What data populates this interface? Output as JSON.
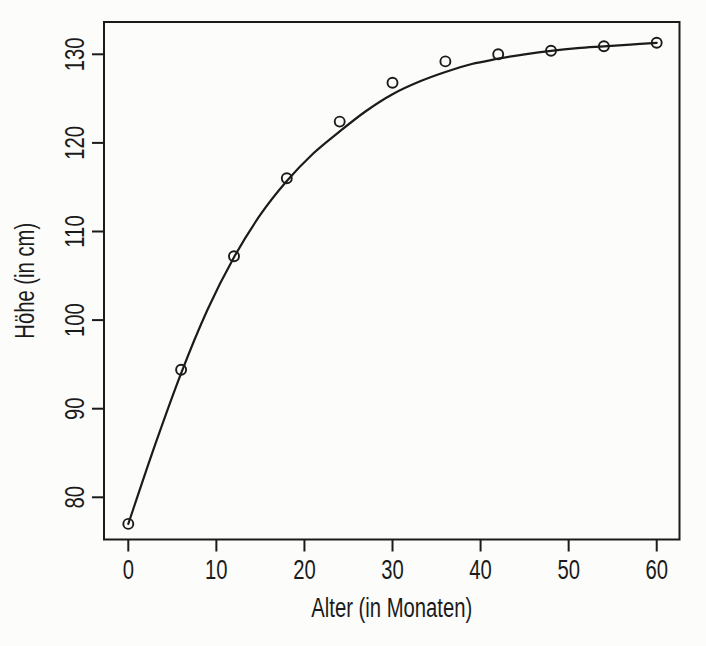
{
  "page": {
    "background": "#fcfcfa",
    "ink_color": "#1b1b1b"
  },
  "chart_data": {
    "type": "scatter",
    "title": "",
    "xlabel": "Alter (in Monaten)",
    "ylabel": "Höhe (in cm)",
    "x_ticks": [
      0,
      10,
      20,
      30,
      40,
      50,
      60
    ],
    "y_ticks": [
      80,
      90,
      100,
      110,
      120,
      130
    ],
    "xlim": [
      -2.8,
      62.6
    ],
    "ylim": [
      75.2,
      133.6
    ],
    "grid": false,
    "legend": "none",
    "marker_style": "open-circle",
    "series": [
      {
        "name": "observed-points",
        "type": "scatter",
        "x": [
          0,
          6,
          12,
          18,
          24,
          30,
          36,
          42,
          48,
          54,
          60
        ],
        "y": [
          77,
          94.4,
          107.2,
          116,
          122.4,
          126.8,
          129.2,
          130,
          130.4,
          130.9,
          131.3
        ]
      },
      {
        "name": "fitted-growth-curve",
        "type": "line",
        "x": [
          0,
          3,
          6,
          9,
          12,
          15,
          18,
          21,
          24,
          27,
          30,
          33,
          36,
          39,
          42,
          45,
          48,
          51,
          54,
          57,
          60
        ],
        "y": [
          77,
          85.8,
          94.0,
          101.2,
          107.1,
          111.9,
          115.7,
          118.8,
          121.3,
          123.6,
          125.5,
          126.9,
          128.0,
          128.9,
          129.5,
          130.0,
          130.4,
          130.7,
          130.9,
          131.1,
          131.3
        ]
      }
    ]
  }
}
